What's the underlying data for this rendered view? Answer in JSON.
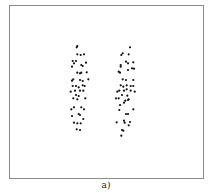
{
  "caption": "a)",
  "colors": {
    "dot": "#111111",
    "frame": "#8a8a8a",
    "background": "#ffffff"
  },
  "chart_data": {
    "type": "scatter",
    "title": "",
    "xlabel": "",
    "ylabel": "",
    "grid": false,
    "legend": null,
    "annotations": [
      "a)"
    ],
    "coordinate_space": "pixel coordinates of the 212x193 image",
    "series": [
      {
        "name": "cluster-left",
        "points": [
          [
            77.3,
            46
          ],
          [
            76.7,
            47.3
          ],
          [
            77.3,
            54.3
          ],
          [
            80.7,
            55
          ],
          [
            84,
            54.3
          ],
          [
            72.7,
            61
          ],
          [
            76,
            61
          ],
          [
            74,
            63.3
          ],
          [
            72,
            66.7
          ],
          [
            82.7,
            66
          ],
          [
            86,
            62.7
          ],
          [
            81.3,
            65
          ],
          [
            77.3,
            72.7
          ],
          [
            80,
            73.3
          ],
          [
            81.3,
            72.7
          ],
          [
            86.7,
            72.3
          ],
          [
            73.3,
            79.3
          ],
          [
            72,
            80.7
          ],
          [
            80,
            80
          ],
          [
            82.7,
            81
          ],
          [
            88.3,
            79.3
          ],
          [
            72.7,
            86
          ],
          [
            76,
            86
          ],
          [
            78.7,
            87.3
          ],
          [
            82.7,
            85.3
          ],
          [
            84.7,
            86
          ],
          [
            70.7,
            91.7
          ],
          [
            75,
            90.7
          ],
          [
            80,
            90.7
          ],
          [
            83.3,
            90.7
          ],
          [
            76,
            95
          ],
          [
            78.7,
            96
          ],
          [
            77.3,
            99.3
          ],
          [
            73.3,
            98.3
          ],
          [
            85.3,
            98.3
          ],
          [
            71.3,
            109.3
          ],
          [
            74,
            107.3
          ],
          [
            81.3,
            107.3
          ],
          [
            84,
            109.3
          ],
          [
            72,
            116
          ],
          [
            78.7,
            114
          ],
          [
            80,
            115
          ],
          [
            83.3,
            119
          ],
          [
            74,
            122.7
          ],
          [
            77.3,
            123.3
          ],
          [
            80.7,
            123.3
          ],
          [
            76.7,
            129.3
          ],
          [
            80,
            130
          ]
        ]
      },
      {
        "name": "cluster-right",
        "points": [
          [
            130,
            47.3
          ],
          [
            122.7,
            53.3
          ],
          [
            121.3,
            55
          ],
          [
            128.7,
            54.3
          ],
          [
            126,
            61.7
          ],
          [
            128,
            63.3
          ],
          [
            120.7,
            65
          ],
          [
            120.7,
            66.7
          ],
          [
            133.3,
            62.3
          ],
          [
            132,
            68.3
          ],
          [
            134,
            68.7
          ],
          [
            128,
            70
          ],
          [
            118.7,
            71.7
          ],
          [
            120,
            72.7
          ],
          [
            122.7,
            79.3
          ],
          [
            126,
            80
          ],
          [
            133.3,
            80
          ],
          [
            120.7,
            85.3
          ],
          [
            123.3,
            86.7
          ],
          [
            126.7,
            85.3
          ],
          [
            130.7,
            86
          ],
          [
            133.3,
            86
          ],
          [
            117.3,
            91.7
          ],
          [
            119.3,
            90.7
          ],
          [
            124,
            90.7
          ],
          [
            126.7,
            89.3
          ],
          [
            130.7,
            90.7
          ],
          [
            134.7,
            91.7
          ],
          [
            116,
            98.3
          ],
          [
            118.7,
            98.3
          ],
          [
            122,
            95
          ],
          [
            127.3,
            95.7
          ],
          [
            128.7,
            99.3
          ],
          [
            125.3,
            100.7
          ],
          [
            120,
            105
          ],
          [
            124,
            102.7
          ],
          [
            128,
            100
          ],
          [
            119.3,
            110
          ],
          [
            133.3,
            109.3
          ],
          [
            126,
            114
          ],
          [
            128,
            114
          ],
          [
            124,
            120.7
          ],
          [
            116.7,
            122.3
          ],
          [
            124.7,
            122.7
          ],
          [
            128.7,
            125.3
          ],
          [
            130,
            122
          ],
          [
            122,
            130
          ],
          [
            123.3,
            130.7
          ],
          [
            121.3,
            135.7
          ]
        ]
      }
    ]
  }
}
